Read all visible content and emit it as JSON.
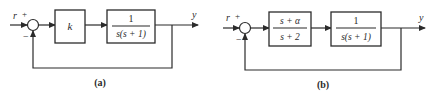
{
  "diagram_a": {
    "label": "(a)",
    "input_signal": "r",
    "input_sign": "+",
    "feedback_sign": "−",
    "output_signal": "y",
    "blocks": [
      {
        "id": "controller",
        "type": "gain",
        "text": "k"
      },
      {
        "id": "plant",
        "type": "fraction",
        "numerator": "1",
        "denominator": "s(s + 1)"
      }
    ],
    "feedback": "unity negative feedback"
  },
  "diagram_b": {
    "label": "(b)",
    "input_signal": "r",
    "input_sign": "+",
    "feedback_sign": "−",
    "output_signal": "y",
    "blocks": [
      {
        "id": "compensator",
        "type": "fraction",
        "numerator": "s + α",
        "denominator": "s + 2"
      },
      {
        "id": "plant",
        "type": "fraction",
        "numerator": "1",
        "denominator": "s(s + 1)"
      }
    ],
    "feedback": "unity negative feedback"
  },
  "colors": {
    "stroke": "#2b2b2b",
    "background": "#ffffff"
  }
}
